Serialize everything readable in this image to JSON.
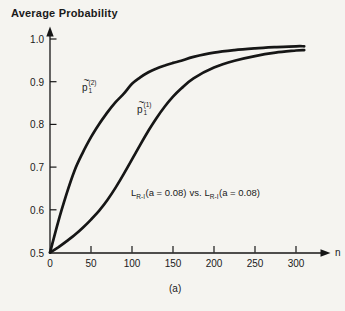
{
  "figure": {
    "title": "Average Probability",
    "x_axis_name": "n",
    "caption": "(a)",
    "curve_labels": [
      {
        "accent": "~",
        "base": "p",
        "sub": "1",
        "sup": "(2)"
      },
      {
        "accent": "~",
        "base": "p",
        "sub": "1",
        "sup": "(1)"
      }
    ],
    "annotation": {
      "left": {
        "base": "L",
        "sub": "R-I",
        "args": "(a = 0.08)"
      },
      "separator": "vs.",
      "right": {
        "base": "L",
        "sub": "R-I",
        "args": "(a = 0.08)"
      }
    },
    "colors": {
      "line": "#161616",
      "text": "#1a1a1a",
      "background": "#f5f4f0"
    }
  },
  "chart_data": {
    "type": "line",
    "title": "Average Probability",
    "xlabel": "n",
    "ylabel": "Average Probability",
    "xlim": [
      0,
      330
    ],
    "ylim": [
      0.5,
      1.0
    ],
    "x_ticks": [
      0,
      50,
      100,
      150,
      200,
      250,
      300
    ],
    "y_ticks": [
      0.5,
      0.6,
      0.7,
      0.8,
      0.9,
      1.0
    ],
    "grid": false,
    "legend": "none",
    "annotation": "L_R-I(a = 0.08) vs. L_R-I(a = 0.08)",
    "caption": "(a)",
    "x": [
      0,
      10,
      20,
      30,
      40,
      50,
      60,
      70,
      80,
      90,
      100,
      110,
      120,
      130,
      140,
      150,
      160,
      175,
      200,
      225,
      250,
      275,
      300,
      310
    ],
    "series": [
      {
        "name": "p~1(2)",
        "values": [
          0.5,
          0.572,
          0.636,
          0.692,
          0.734,
          0.77,
          0.801,
          0.828,
          0.852,
          0.872,
          0.895,
          0.91,
          0.922,
          0.931,
          0.938,
          0.944,
          0.949,
          0.958,
          0.968,
          0.974,
          0.978,
          0.981,
          0.983,
          0.983
        ]
      },
      {
        "name": "p~1(1)",
        "values": [
          0.5,
          0.512,
          0.526,
          0.541,
          0.558,
          0.577,
          0.598,
          0.623,
          0.652,
          0.684,
          0.718,
          0.752,
          0.785,
          0.815,
          0.842,
          0.865,
          0.884,
          0.908,
          0.933,
          0.949,
          0.96,
          0.968,
          0.973,
          0.974
        ]
      }
    ]
  }
}
